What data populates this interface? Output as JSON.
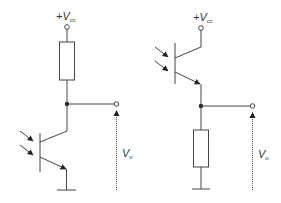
{
  "diagram": {
    "circuits": [
      {
        "name": "common-emitter",
        "supply_label": {
          "plus": "+",
          "V": "V",
          "sub": "cc"
        },
        "output_label": {
          "V": "V",
          "sub": "o"
        },
        "components": [
          "resistor (collector load)",
          "phototransistor",
          "ground"
        ]
      },
      {
        "name": "common-collector",
        "supply_label": {
          "plus": "+",
          "V": "V",
          "sub": "cc"
        },
        "output_label": {
          "V": "V",
          "sub": "o"
        },
        "components": [
          "phototransistor",
          "resistor (emitter load)",
          "ground"
        ]
      }
    ],
    "colors": {
      "line": "#444444",
      "background": "#ffffff"
    }
  }
}
